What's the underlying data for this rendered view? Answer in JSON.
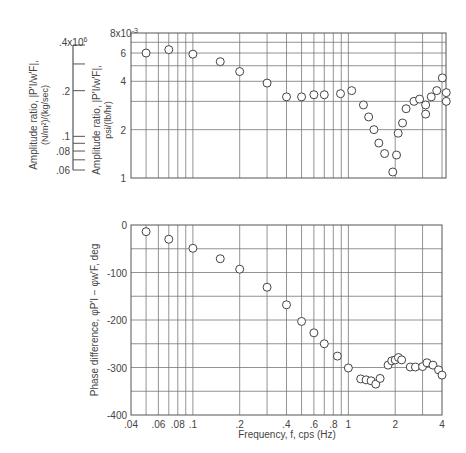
{
  "chart_data": [
    {
      "type": "scatter",
      "title": "",
      "xlabel": "Frequency, f, cps (Hz)",
      "ylabel": "Amplitude ratio, |P'_I/w'_F|, psi/(lb/hr)",
      "ylabel_secondary": "Amplitude ratio, |P'_I/w'_F|, (N/m^2)/(kg/sec)",
      "x_scale": "log",
      "y_scale": "log",
      "xlim": [
        0.04,
        4.3
      ],
      "ylim": [
        1,
        8
      ],
      "y_multiplier_label": "8x10^-3",
      "y_ticks": [
        "1",
        "2",
        "4",
        "6",
        "8x10^-3"
      ],
      "y_secondary_ticks": [
        ".06",
        ".08",
        ".1",
        ".2",
        ".4x10^6"
      ],
      "grid": true,
      "marker": "open-circle",
      "series": [
        {
          "name": "Amplitude ratio (x10^-3 psi/(lb/hr))",
          "x": [
            0.05,
            0.07,
            0.1,
            0.15,
            0.2,
            0.3,
            0.4,
            0.5,
            0.6,
            0.7,
            0.89,
            1.05,
            1.25,
            1.35,
            1.46,
            1.57,
            1.71,
            1.93,
            2.04,
            2.09,
            2.23,
            2.35,
            2.64,
            2.87,
            3.14,
            3.14,
            3.41,
            3.7,
            4.02,
            4.26,
            4.26
          ],
          "y": [
            6.0,
            6.3,
            5.9,
            5.3,
            4.6,
            3.9,
            3.2,
            3.2,
            3.3,
            3.3,
            3.35,
            3.5,
            2.85,
            2.4,
            2.0,
            1.65,
            1.42,
            1.09,
            1.39,
            1.9,
            2.2,
            2.7,
            3.0,
            3.1,
            2.85,
            2.5,
            3.2,
            3.5,
            4.2,
            3.4,
            3.0
          ]
        }
      ]
    },
    {
      "type": "scatter",
      "title": "",
      "xlabel": "Frequency, f, cps (Hz)",
      "ylabel": "Phase difference, φP'_I − φw'_F, deg",
      "x_scale": "log",
      "y_scale": "linear",
      "xlim": [
        0.04,
        4.0
      ],
      "ylim": [
        -400,
        0
      ],
      "x_ticks": [
        ".04",
        ".06",
        ".08",
        ".1",
        ".2",
        ".4",
        ".6",
        ".8",
        "1",
        "2",
        "4"
      ],
      "y_ticks": [
        "0",
        "-100",
        "-200",
        "-300",
        "-400"
      ],
      "grid": true,
      "marker": "open-circle",
      "series": [
        {
          "name": "Phase difference (deg)",
          "x": [
            0.05,
            0.07,
            0.1,
            0.15,
            0.2,
            0.3,
            0.4,
            0.5,
            0.6,
            0.7,
            0.85,
            1.0,
            1.2,
            1.3,
            1.4,
            1.5,
            1.6,
            1.8,
            1.9,
            2.0,
            2.1,
            2.2,
            2.5,
            2.7,
            3.0,
            3.2,
            3.5,
            3.8,
            4.0
          ],
          "y": [
            -14,
            -30,
            -49,
            -71,
            -93,
            -131,
            -168,
            -203,
            -227,
            -250,
            -276,
            -301,
            -324,
            -326,
            -328,
            -335,
            -323,
            -295,
            -286,
            -284,
            -279,
            -284,
            -299,
            -299,
            -298,
            -290,
            -295,
            -305,
            -316
          ]
        }
      ]
    }
  ],
  "labels": {
    "top_y_multiplier": "8x10",
    "top_y_exp": "-3",
    "top_ylabel_line1": "Amplitude ratio, |P'I/w'F|,",
    "top_ylabel_line2": "psi/(lb/hr)",
    "si_ylabel_line1": "Amplitude ratio, |P'I/w'F|,",
    "si_ylabel_line2": "(N/m²)/(kg/sec)",
    "si_top_tick": ".4x10",
    "si_top_exp": "6",
    "bottom_ylabel": "Phase difference, φP'I − φw'F, deg",
    "xlabel": "Frequency, f, cps (Hz)"
  }
}
